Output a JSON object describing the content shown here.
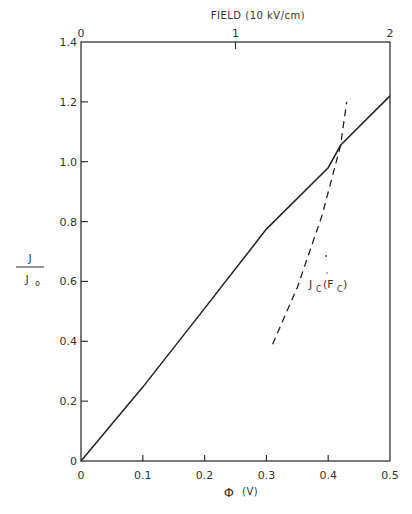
{
  "chart_data": {
    "type": "line",
    "title": "",
    "xlabel": "Φ (V)",
    "ylabel": "J / J0",
    "top_axis_label": "FIELD (10 kV/cm)",
    "xlim": [
      0,
      0.5
    ],
    "ylim": [
      0,
      1.4
    ],
    "x_ticks": [
      0,
      0.1,
      0.2,
      0.3,
      0.4,
      0.5
    ],
    "x_tick_labels": [
      "0",
      "0.1",
      "0.2",
      "0.3",
      "0.4",
      "0.5"
    ],
    "y_ticks": [
      0,
      0.2,
      0.4,
      0.6,
      0.8,
      1.0,
      1.2,
      1.4
    ],
    "y_tick_labels": [
      "0",
      "0.2",
      "0.4",
      "0.6",
      "0.8",
      "1.0",
      "1.2",
      "1.4"
    ],
    "top_ticks": [
      0,
      1,
      2
    ],
    "top_tick_labels": [
      "0",
      "1",
      "2"
    ],
    "grid": false,
    "legend": null,
    "series": [
      {
        "name": "J/J0",
        "style": "solid",
        "x": [
          0,
          0.1,
          0.2,
          0.3,
          0.4,
          0.42,
          0.5
        ],
        "y": [
          0,
          0.247,
          0.51,
          0.775,
          0.98,
          1.055,
          1.22
        ]
      },
      {
        "name": "Jc(Fc)",
        "style": "dashed",
        "x": [
          0.31,
          0.35,
          0.39,
          0.42,
          0.43
        ],
        "y": [
          0.39,
          0.58,
          0.82,
          1.055,
          1.2
        ]
      }
    ],
    "annotations": [
      {
        "text": "Jc(Fc)",
        "x": 0.37,
        "y": 0.6
      }
    ]
  },
  "labels": {
    "top_axis_title": "FIELD (10 kV/cm)",
    "x_axis_title_symbol": "Φ",
    "x_axis_title_unit": "(V)",
    "y_num": "J",
    "y_den": "J",
    "y_den_sub": "o",
    "annot_main": "J",
    "annot_sub1": "C",
    "annot_open": "(F",
    "annot_sub2": "C",
    "annot_close": ")"
  }
}
